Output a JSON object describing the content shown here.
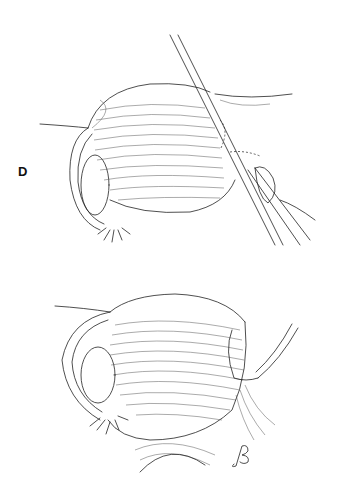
{
  "figure": {
    "panels": [
      {
        "id": "D",
        "label": "D",
        "description": "Uterus with laparoscopic instruments at right cornu; left ovary and fimbriated tube visible"
      },
      {
        "id": "F",
        "label": "F",
        "description": "Uterus after procedure with sutured right cornu; left ovary and fimbriated tube visible"
      }
    ],
    "signature": "artist-monogram",
    "colors": {
      "ink": "#222222",
      "background": "#ffffff"
    }
  }
}
